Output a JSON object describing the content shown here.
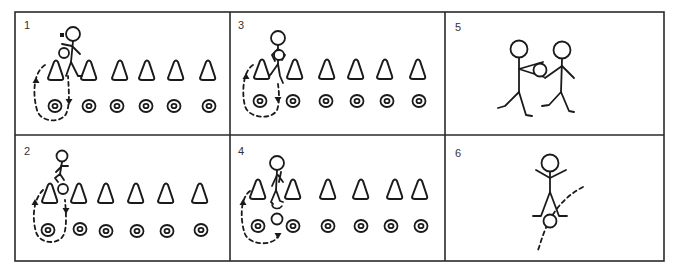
{
  "figure": {
    "width": 680,
    "height": 273,
    "border": {
      "x": 15,
      "y": 12,
      "w": 649,
      "h": 249,
      "color": "#2a2a2a"
    },
    "dividers": {
      "vertical_x": [
        230,
        445
      ],
      "horizontal_y": 135
    },
    "ink_color": "#1a1a1a"
  },
  "panels": [
    {
      "id": 1,
      "label": "1",
      "label_pos": [
        24,
        29
      ],
      "description": "Player with ball at first cone; dashed loop path from first cone down around first ring and back up",
      "cones": [
        [
          56,
          71
        ],
        [
          89,
          71
        ],
        [
          120,
          71
        ],
        [
          147,
          71
        ],
        [
          176,
          71
        ],
        [
          208,
          71
        ]
      ],
      "rings": [
        [
          55,
          106
        ],
        [
          89,
          106
        ],
        [
          117,
          106
        ],
        [
          146,
          106
        ],
        [
          174,
          106
        ],
        [
          209,
          106
        ]
      ],
      "player": {
        "head": [
          73,
          34
        ],
        "pose": "standing-with-ball"
      },
      "ball": [
        64,
        53
      ],
      "path": "M 45 65 C 34 72, 32 92, 37 110 C 40 122, 60 124, 66 114 C 70 106, 69 92, 68 76",
      "arrows": [
        {
          "at": [
            36,
            80
          ],
          "dir": "up"
        },
        {
          "at": [
            69,
            102
          ],
          "dir": "down"
        }
      ]
    },
    {
      "id": 2,
      "label": "2",
      "label_pos": [
        24,
        155
      ],
      "description": "Player hops over first cone with ball; dashed loop path",
      "cones": [
        [
          50,
          194
        ],
        [
          79,
          194
        ],
        [
          106,
          194
        ],
        [
          136,
          194
        ],
        [
          166,
          194
        ],
        [
          200,
          194
        ]
      ],
      "rings": [
        [
          48,
          230
        ],
        [
          80,
          229
        ],
        [
          106,
          231
        ],
        [
          137,
          231
        ],
        [
          167,
          231
        ],
        [
          201,
          230
        ]
      ],
      "player": {
        "head": [
          62,
          156
        ],
        "pose": "hopping"
      },
      "ball": [
        63,
        189
      ],
      "path": "M 43 190 C 33 200, 32 218, 36 232 C 40 245, 60 245, 64 234 C 67 226, 66 212, 65 200",
      "arrows": [
        {
          "at": [
            35,
            202
          ],
          "dir": "up"
        },
        {
          "at": [
            66,
            211
          ],
          "dir": "down"
        }
      ]
    },
    {
      "id": 3,
      "label": "3",
      "label_pos": [
        238,
        29
      ],
      "description": "Player steps over cone line carrying ball at chest; dashed loop path",
      "cones": [
        [
          262,
          70
        ],
        [
          295,
          70
        ],
        [
          327,
          70
        ],
        [
          356,
          70
        ],
        [
          385,
          70
        ],
        [
          418,
          70
        ]
      ],
      "rings": [
        [
          260,
          101
        ],
        [
          293,
          101
        ],
        [
          326,
          101
        ],
        [
          357,
          101
        ],
        [
          387,
          101
        ],
        [
          419,
          101
        ]
      ],
      "player": {
        "head": [
          278,
          38
        ],
        "pose": "stepping-with-ball-chest"
      },
      "ball": [
        279,
        55
      ],
      "path": "M 253 65 C 242 72, 242 95, 245 106 C 249 119, 272 120, 277 110 C 280 102, 279 92, 278 84",
      "arrows": [
        {
          "at": [
            246,
            76
          ],
          "dir": "up"
        },
        {
          "at": [
            278,
            100
          ],
          "dir": "down"
        }
      ]
    },
    {
      "id": 4,
      "label": "4",
      "label_pos": [
        238,
        155
      ],
      "description": "Player straddles cone; ball rolls down to ring; dashed loop path",
      "cones": [
        [
          258,
          190
        ],
        [
          293,
          190
        ],
        [
          328,
          190
        ],
        [
          361,
          190
        ],
        [
          395,
          190
        ],
        [
          420,
          190
        ]
      ],
      "rings": [
        [
          258,
          226
        ],
        [
          293,
          226
        ],
        [
          328,
          226
        ],
        [
          361,
          226
        ],
        [
          391,
          226
        ],
        [
          421,
          226
        ]
      ],
      "player": {
        "head": [
          277,
          163
        ],
        "pose": "straddling-cone"
      },
      "ball": [
        277,
        219
      ],
      "path": "M 250 191 C 240 198, 240 220, 245 234 C 250 246, 274 246, 278 236",
      "arrows": [
        {
          "at": [
            243,
            202
          ],
          "dir": "up"
        },
        {
          "at": [
            278,
            236
          ],
          "dir": "down"
        }
      ]
    },
    {
      "id": 5,
      "label": "5",
      "label_pos": [
        455,
        31
      ],
      "description": "Two players walking; one passes ball to the other",
      "players": [
        {
          "head": [
            519,
            49
          ],
          "pose": "walking-passing"
        },
        {
          "head": [
            562,
            50
          ],
          "pose": "walking-receiving"
        }
      ],
      "ball": [
        539,
        70
      ]
    },
    {
      "id": 6,
      "label": "6",
      "label_pos": [
        455,
        157
      ],
      "description": "Player with arms raised jumps as ball passes underneath along dashed arc",
      "player": {
        "head": [
          550,
          163
        ],
        "pose": "jumping-arms-up"
      },
      "ball": [
        550,
        221
      ],
      "path": "M 583 187 C 565 196, 552 212, 545 230 C 541 240, 539 248, 538 250"
    }
  ]
}
